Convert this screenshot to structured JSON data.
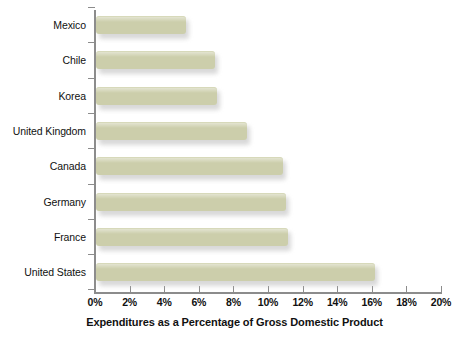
{
  "chart_data": {
    "type": "bar",
    "orientation": "horizontal",
    "title": "",
    "xlabel": "Expenditures as a Percentage of Gross Domestic Product",
    "ylabel": "",
    "categories": [
      "Mexico",
      "Chile",
      "Korea",
      "United Kingdom",
      "Canada",
      "Germany",
      "France",
      "United States"
    ],
    "values": [
      5.2,
      6.9,
      7.0,
      8.7,
      10.8,
      11.0,
      11.1,
      16.1
    ],
    "value_unit": "%",
    "xlim": [
      0,
      20
    ],
    "xticks": [
      0,
      2,
      4,
      6,
      8,
      10,
      12,
      14,
      16,
      18,
      20
    ],
    "xtick_labels": [
      "0%",
      "2%",
      "4%",
      "6%",
      "8%",
      "10%",
      "12%",
      "14%",
      "16%",
      "18%",
      "20%"
    ],
    "grid": false,
    "legend": false,
    "series": [
      {
        "name": "Expenditures as a Percentage of Gross Domestic Product",
        "values": [
          5.2,
          6.9,
          7.0,
          8.7,
          10.8,
          11.0,
          11.1,
          16.1
        ]
      }
    ]
  },
  "colors": {
    "bar_fill": "#ccceab",
    "bar_shadow": "#b9b9b9",
    "axis": "#8c8c8c",
    "text": "#111111",
    "background": "#ffffff"
  }
}
